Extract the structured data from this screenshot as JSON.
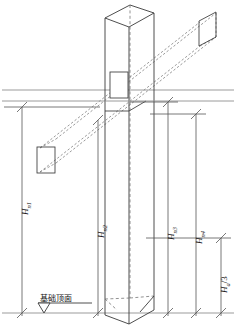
{
  "figure": {
    "type": "structural-axonometric-diagram",
    "width": 236,
    "height": 331,
    "background": "#ffffff"
  },
  "colors": {
    "solid_line": "#3a3a3a",
    "dashed_line": "#6e6e6e",
    "dimension_line": "#555555",
    "reference_line": "#9b9b9b",
    "text": "#1a1a1a"
  },
  "annotations": {
    "datum": {
      "label": "基础顶面",
      "symbol": "level-triangle",
      "name": "foundation-top-surface"
    },
    "dimensions": [
      {
        "id": "Hn1",
        "base": "H",
        "sub": "n1",
        "label": "H n1",
        "x": 22,
        "top": 107,
        "bottom": 313
      },
      {
        "id": "Hn2",
        "base": "H",
        "sub": "n2",
        "label": "H n2",
        "x": 98,
        "top": 120,
        "bottom": 313
      },
      {
        "id": "Hn3",
        "base": "H",
        "sub": "n3",
        "label": "H n3",
        "x": 168,
        "top": 102,
        "bottom": 313
      },
      {
        "id": "Hn4",
        "base": "H",
        "sub": "n4",
        "label": "H n4",
        "x": 196,
        "top": 114,
        "bottom": 313
      },
      {
        "id": "Ha3",
        "base": "H",
        "sub": "a",
        "suffix": "/3",
        "label": "H a/3",
        "x": 221,
        "top": 238,
        "bottom": 313
      }
    ]
  },
  "geometry": {
    "column": {
      "name": "vertical-column",
      "note": "Tall rectangular prism drawn in axonometric projection, hidden edge dashed."
    },
    "beam": {
      "name": "inclined-beam",
      "note": "Rectangular prism inclined from lower-left to upper-right, drawn with dashed (hidden) edges, passing through the column."
    },
    "reference_lines": [
      {
        "name": "upper-reference-line",
        "y": 90
      },
      {
        "name": "lower-reference-line",
        "y": 111
      },
      {
        "name": "foundation-baseline",
        "y": 313
      }
    ]
  }
}
